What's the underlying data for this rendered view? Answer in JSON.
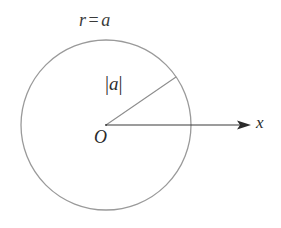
{
  "figure": {
    "background_color": "#ffffff",
    "width": 281,
    "height": 228
  },
  "labels": {
    "circle_equation_r": "r",
    "circle_equation_eq": "=",
    "circle_equation_a": "a",
    "radius_magnitude_open": "|",
    "radius_magnitude_value": "a",
    "radius_magnitude_close": "|",
    "origin": "O",
    "x_axis": "x"
  },
  "geometry": {
    "center_x": 106,
    "center_y": 125,
    "radius": 85,
    "circle_stroke_color": "#9a9a9a",
    "circle_stroke_width": 1.3,
    "radius_line_color": "#8d8d8d",
    "radius_line_width": 1.1,
    "radius_line_end_x": 176,
    "radius_line_end_y": 77,
    "axis_line_color": "#3b3b3b",
    "axis_line_width": 1.2,
    "axis_end_x": 251,
    "arrow_color": "#2b2b2b"
  }
}
